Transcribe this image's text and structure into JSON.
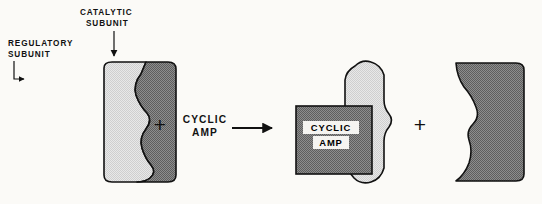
{
  "diagram": {
    "background_color": "#fbfaf7",
    "ink_color": "#111111"
  },
  "labels": {
    "regulatory": {
      "line1": "REGULATORY",
      "line2": "SUBUNIT",
      "pointer": "elbow-arrow"
    },
    "catalytic": {
      "line1": "CATALYTIC",
      "line2": "SUBUNIT",
      "pointer": "down-arrow"
    }
  },
  "equation": {
    "plus_left": "+",
    "reagent_line1": "CYCLIC",
    "reagent_line2": "AMP",
    "reaction_arrow": "right-arrow",
    "plus_right": "+"
  },
  "bound_ligand": {
    "line1": "CYCLIC",
    "line2": "AMP"
  },
  "subunits": {
    "regulatory_fill": "#dcdcdc",
    "catalytic_fill": "#7d7d7d",
    "outline": "#111111",
    "regulatory_name": "regulatory-subunit",
    "catalytic_name": "catalytic-subunit"
  },
  "shapes": {
    "holoenzyme_regulatory_path": "M 104 68 Q 104 62 112 62 L 146 62 L 141 74 Q 133 84 136 95 Q 140 106 147 113 Q 153 120 146 129 Q 139 138 142 148 Q 145 158 151 165 Q 157 172 150 178 Q 145 182 137 182 L 112 182 Q 104 182 104 175 Z",
    "holoenzyme_catalytic_path": "M 146 62 L 168 62 Q 176 62 176 69 L 176 175 Q 176 182 168 182 L 137 182 Q 145 182 150 178 Q 157 172 151 165 Q 145 158 142 148 Q 139 138 146 129 Q 153 120 147 113 Q 140 106 136 95 Q 133 84 141 74 Z",
    "free_regulatory_path": "M 355 66 Q 362 59 371 62 Q 381 65 384 75 L 384 100 Q 384 108 389 114 Q 394 120 389 127 Q 384 133 384 141 L 384 168 Q 381 179 371 182 Q 361 185 354 178 Q 348 172 348 163 L 348 146 Q 347 138 341 133 Q 335 128 340 121 Q 345 115 345 107 L 345 80 Q 346 71 355 66 Z",
    "free_catalytic_path": "M 456 63 L 516 63 Q 524 63 524 70 L 524 174 Q 524 181 516 181 L 456 181 Q 465 174 469 163 Q 473 151 469 140 Q 466 131 473 124 Q 480 117 476 107 Q 472 96 464 87 Q 457 77 456 63 Z",
    "camp_box": {
      "x": 296,
      "y": 106,
      "width": 76,
      "height": 68
    }
  }
}
